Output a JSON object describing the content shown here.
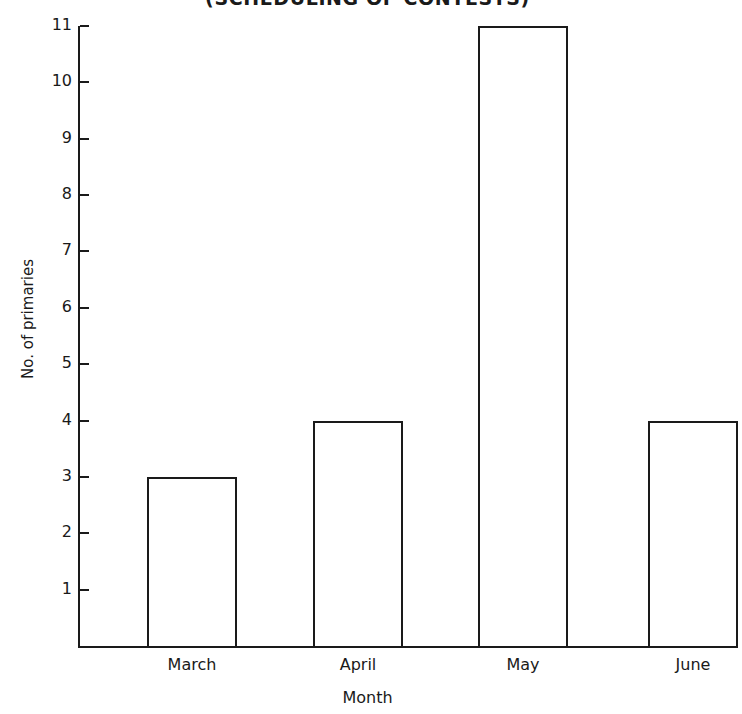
{
  "title": {
    "text": "(SCHEDULING OF CONTESTS)",
    "clipped": true
  },
  "chart_data": {
    "type": "bar",
    "title": "(SCHEDULING OF CONTESTS)",
    "xlabel": "Month",
    "ylabel": "No. of primaries",
    "categories": [
      "March",
      "April",
      "May",
      "June"
    ],
    "values": [
      3,
      4,
      11,
      4
    ],
    "ylim": [
      0,
      11
    ],
    "yticks": [
      1,
      2,
      3,
      4,
      5,
      6,
      7,
      8,
      9,
      10,
      11
    ],
    "ytick_labels": [
      "1",
      "2",
      "3",
      "4",
      "5",
      "6",
      "7",
      "8",
      "9",
      "10",
      "11"
    ],
    "grid": false,
    "legend": null,
    "bar_style": "outline",
    "bar_fill": "#ffffff",
    "bar_edge": "#1a1a1a"
  },
  "colors": {
    "background": "#ffffff",
    "ink": "#1a1a1a"
  }
}
